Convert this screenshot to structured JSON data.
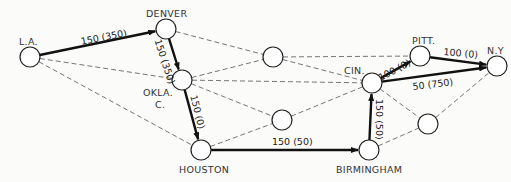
{
  "diagram": {
    "colors": {
      "background": "#fbfbfa",
      "stroke": "#111111",
      "dashed": "#666666",
      "node_fill": "#ffffff"
    },
    "nodes": [
      {
        "id": "la",
        "label": "L.A.",
        "x": 30,
        "y": 57
      },
      {
        "id": "denver",
        "label": "DENVER",
        "x": 166,
        "y": 29
      },
      {
        "id": "okla",
        "label": "OKLA.",
        "label2": "C.",
        "x": 182,
        "y": 80
      },
      {
        "id": "houston",
        "label": "HOUSTON",
        "x": 201,
        "y": 150
      },
      {
        "id": "mid_top",
        "label": "",
        "x": 273,
        "y": 57
      },
      {
        "id": "mid_bot",
        "label": "",
        "x": 282,
        "y": 120
      },
      {
        "id": "cin",
        "label": "CIN.",
        "x": 372,
        "y": 83
      },
      {
        "id": "birmingham",
        "label": "BIRMINGHAM",
        "x": 369,
        "y": 150
      },
      {
        "id": "pitt",
        "label": "PITT.",
        "x": 420,
        "y": 56
      },
      {
        "id": "ny",
        "label": "N.Y",
        "x": 497,
        "y": 66
      },
      {
        "id": "right_bot",
        "label": "",
        "x": 428,
        "y": 124
      }
    ],
    "flow_edges": [
      {
        "from": "la",
        "to": "denver",
        "label": "150 (350)"
      },
      {
        "from": "denver",
        "to": "okla",
        "label": "150 (350)"
      },
      {
        "from": "okla",
        "to": "houston",
        "label": "150 (0)"
      },
      {
        "from": "houston",
        "to": "birmingham",
        "label": "150 (50)"
      },
      {
        "from": "birmingham",
        "to": "cin",
        "label": "150 (50)"
      },
      {
        "from": "cin",
        "to": "pitt",
        "label": "100 (0)"
      },
      {
        "from": "pitt",
        "to": "ny",
        "label": "100 (0)"
      },
      {
        "from": "cin",
        "to": "ny",
        "label": "50 (750)"
      }
    ],
    "dashed_edges": [
      [
        "la",
        "okla"
      ],
      [
        "la",
        "houston"
      ],
      [
        "denver",
        "mid_top"
      ],
      [
        "okla",
        "mid_top"
      ],
      [
        "okla",
        "cin"
      ],
      [
        "okla",
        "mid_bot"
      ],
      [
        "mid_top",
        "cin"
      ],
      [
        "mid_top",
        "pitt"
      ],
      [
        "houston",
        "mid_bot"
      ],
      [
        "mid_bot",
        "cin"
      ],
      [
        "cin",
        "right_bot"
      ],
      [
        "birmingham",
        "right_bot"
      ],
      [
        "right_bot",
        "ny"
      ]
    ]
  }
}
